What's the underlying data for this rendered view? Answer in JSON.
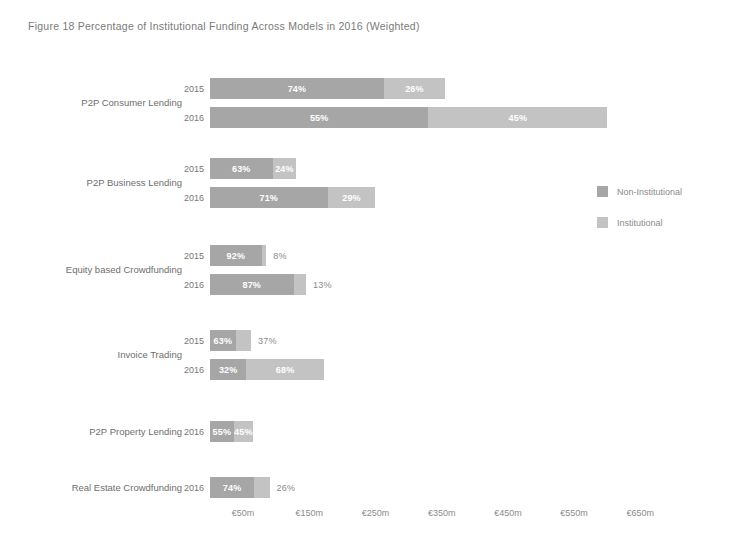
{
  "figure": {
    "title": "Figure 18  Percentage of Institutional Funding Across Models in 2016 (Weighted)"
  },
  "legend": {
    "position": "right",
    "items": [
      {
        "label": "Non-Institutional",
        "color": "#a6a6a6"
      },
      {
        "label": "Institutional",
        "color": "#c3c3c3"
      }
    ]
  },
  "axis": {
    "ticks": [
      "€50m",
      "€150m",
      "€250m",
      "€350m",
      "€450m",
      "€550m",
      "€650m"
    ]
  },
  "groups": [
    {
      "category": "P2P Consumer Lending",
      "rows": [
        {
          "year": "2015",
          "total_m": 355,
          "noninst_label": "74%",
          "inst_label": "26%",
          "noninst_pct": 74,
          "inst_pct": 26
        },
        {
          "year": "2016",
          "total_m": 600,
          "noninst_label": "55%",
          "inst_label": "45%",
          "noninst_pct": 55,
          "inst_pct": 45
        }
      ]
    },
    {
      "category": "P2P Business Lending",
      "rows": [
        {
          "year": "2015",
          "total_m": 150,
          "noninst_label": "63%",
          "inst_label": "24%",
          "noninst_pct": 63,
          "inst_pct": 24
        },
        {
          "year": "2016",
          "total_m": 250,
          "noninst_label": "71%",
          "inst_label": "29%",
          "noninst_pct": 71,
          "inst_pct": 29
        }
      ]
    },
    {
      "category": "Equity based Crowdfunding",
      "rows": [
        {
          "year": "2015",
          "total_m": 85,
          "noninst_label": "92%",
          "inst_label": "8%",
          "noninst_pct": 92,
          "inst_pct": 8,
          "inst_outside": true
        },
        {
          "year": "2016",
          "total_m": 145,
          "noninst_label": "87%",
          "inst_label": "13%",
          "noninst_pct": 87,
          "inst_pct": 13,
          "inst_outside": true
        }
      ]
    },
    {
      "category": "Invoice Trading",
      "rows": [
        {
          "year": "2015",
          "total_m": 62,
          "noninst_label": "63%",
          "inst_label": "37%",
          "noninst_pct": 63,
          "inst_pct": 37,
          "inst_outside": true
        },
        {
          "year": "2016",
          "total_m": 172,
          "noninst_label": "32%",
          "inst_label": "68%",
          "noninst_pct": 32,
          "inst_pct": 68
        }
      ]
    },
    {
      "category": "P2P Property Lending",
      "rows": [
        {
          "year": "2016",
          "total_m": 65,
          "noninst_label": "55%",
          "inst_label": "45%",
          "noninst_pct": 55,
          "inst_pct": 45
        }
      ]
    },
    {
      "category": "Real Estate Crowdfunding",
      "rows": [
        {
          "year": "2016",
          "total_m": 90,
          "noninst_label": "74%",
          "inst_label": "26%",
          "noninst_pct": 74,
          "inst_pct": 26,
          "inst_outside": true
        }
      ]
    }
  ],
  "chart_data": {
    "type": "bar",
    "orientation": "horizontal",
    "stacked": true,
    "title": "Figure 18  Percentage of Institutional Funding Across Models in 2016 (Weighted)",
    "xlabel": "",
    "ylabel": "",
    "xticks": [
      "€50m",
      "€150m",
      "€250m",
      "€350m",
      "€450m",
      "€550m",
      "€650m"
    ],
    "xtick_values": [
      50,
      150,
      250,
      350,
      450,
      550,
      650
    ],
    "xlim": [
      0,
      700
    ],
    "grid": false,
    "legend": [
      "Non-Institutional",
      "Institutional"
    ],
    "legend_position": "right",
    "categories": [
      "P2P Consumer Lending 2015",
      "P2P Consumer Lending 2016",
      "P2P Business Lending 2015",
      "P2P Business Lending 2016",
      "Equity based Crowdfunding 2015",
      "Equity based Crowdfunding 2016",
      "Invoice Trading 2015",
      "Invoice Trading 2016",
      "P2P Property Lending 2016",
      "Real Estate Crowdfunding 2016"
    ],
    "series": [
      {
        "name": "Non-Institutional",
        "values_pct": [
          74,
          55,
          63,
          71,
          92,
          87,
          63,
          32,
          55,
          74
        ]
      },
      {
        "name": "Institutional",
        "values_pct": [
          26,
          45,
          24,
          29,
          8,
          13,
          37,
          68,
          45,
          26
        ]
      }
    ],
    "bar_totals_m": [
      355,
      600,
      150,
      250,
      85,
      145,
      62,
      172,
      65,
      90
    ]
  }
}
